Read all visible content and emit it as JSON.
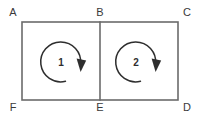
{
  "figure": {
    "type": "geometry-diagram",
    "background_color": "#ffffff",
    "line_color": "#6b6b6b",
    "ink_color": "#2e2e2e",
    "vertices": [
      {
        "label": "A",
        "x": 13,
        "y": 13,
        "corner": "top-left"
      },
      {
        "label": "B",
        "x": 100,
        "y": 13,
        "corner": "top-middle"
      },
      {
        "label": "C",
        "x": 187,
        "y": 13,
        "corner": "top-right"
      },
      {
        "label": "F",
        "x": 13,
        "y": 108,
        "corner": "bottom-left"
      },
      {
        "label": "E",
        "x": 100,
        "y": 108,
        "corner": "bottom-middle"
      },
      {
        "label": "D",
        "x": 187,
        "y": 108,
        "corner": "bottom-right"
      }
    ],
    "rectangle": {
      "left": 22,
      "top": 22,
      "right": 178,
      "bottom": 100
    },
    "divider": {
      "x": 100,
      "top": 22,
      "bottom": 100
    },
    "regions": [
      {
        "label": "1",
        "label_x": 61,
        "label_y": 66,
        "arrow_direction": "clockwise",
        "center_x": 62,
        "center_y": 62,
        "radius": 20
      },
      {
        "label": "2",
        "label_x": 136,
        "label_y": 66,
        "arrow_direction": "clockwise",
        "center_x": 137,
        "center_y": 62,
        "radius": 20
      }
    ]
  }
}
